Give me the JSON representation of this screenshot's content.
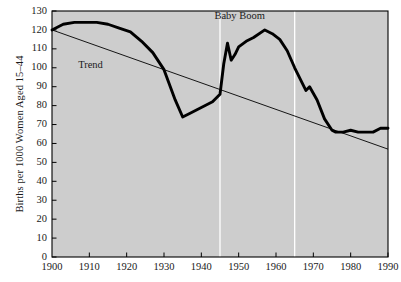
{
  "chart_data": {
    "type": "line",
    "title": "",
    "xlabel": "",
    "ylabel": "Births per 1000 Women Aged 15–44",
    "xlim": [
      1900,
      1990
    ],
    "ylim": [
      0,
      130
    ],
    "grid": false,
    "legend": "none",
    "plot_bgcolor": "#cdcdcd",
    "line_color": "#000000",
    "marker_line_color": "#ffffff",
    "xticks": [
      1900,
      1910,
      1920,
      1930,
      1940,
      1950,
      1960,
      1970,
      1980,
      1990
    ],
    "xtick_labels": [
      "1900",
      "1910",
      "1920",
      "1930",
      "1940",
      "1950",
      "1960",
      "1970",
      "1980",
      "1990"
    ],
    "yticks": [
      0,
      10,
      20,
      30,
      40,
      50,
      60,
      70,
      80,
      90,
      100,
      110,
      120,
      130
    ],
    "ytick_labels": [
      "0",
      "10",
      "20",
      "30",
      "40",
      "50",
      "60",
      "70",
      "80",
      "90",
      "100",
      "110",
      "120",
      "130"
    ],
    "vertical_markers": [
      1945,
      1965
    ],
    "annotations": [
      {
        "name": "trend",
        "text": "Trend",
        "x": 1907,
        "y": 101
      },
      {
        "name": "baby-boom",
        "text": "Baby Boom",
        "x": 1951,
        "y": 127
      }
    ],
    "series": [
      {
        "name": "Birth rate",
        "x": [
          1900,
          1903,
          1906,
          1909,
          1912,
          1915,
          1918,
          1921,
          1924,
          1927,
          1930,
          1933,
          1935,
          1937,
          1940,
          1943,
          1945,
          1946,
          1947,
          1948,
          1949,
          1950,
          1952,
          1954,
          1957,
          1959,
          1961,
          1963,
          1965,
          1967,
          1968,
          1969,
          1971,
          1973,
          1975,
          1976,
          1978,
          1980,
          1982,
          1984,
          1986,
          1988,
          1990
        ],
        "y": [
          120,
          123,
          124,
          124,
          124,
          123,
          121,
          119,
          114,
          108,
          99,
          83,
          74,
          76,
          79,
          82,
          86,
          102,
          113,
          104,
          107,
          111,
          114,
          116,
          120,
          118,
          115,
          109,
          100,
          92,
          88,
          90,
          83,
          73,
          67,
          66,
          66,
          67,
          66,
          66,
          66,
          68,
          68
        ]
      }
    ],
    "trend_line": {
      "name": "Trend",
      "x": [
        1900,
        1990
      ],
      "y": [
        120,
        57
      ],
      "color": "#000000"
    }
  }
}
